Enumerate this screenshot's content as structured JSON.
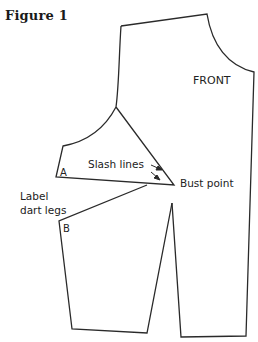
{
  "figure": {
    "title": "Figure 1"
  },
  "labels": {
    "front": "FRONT",
    "slash_lines": "Slash lines",
    "bust_point": "Bust point",
    "label_line1": "Label",
    "label_line2": "dart legs",
    "point_a": "A",
    "point_b": "B"
  },
  "colors": {
    "line": "#2a2a2a",
    "text": "#222222",
    "background": "#ffffff"
  }
}
